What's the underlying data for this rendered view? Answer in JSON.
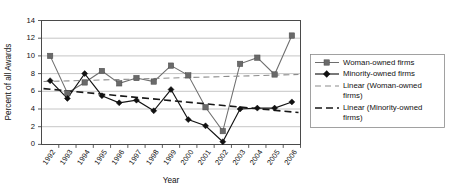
{
  "chart_data": {
    "type": "line",
    "title": "",
    "xlabel": "Year",
    "ylabel": "Percent of all Awards",
    "categories": [
      "1992",
      "1993",
      "1994",
      "1995",
      "1996",
      "1997",
      "1998",
      "1999",
      "2000",
      "2001",
      "2002",
      "2003",
      "2004",
      "2005",
      "2006"
    ],
    "ylim": [
      0,
      14
    ],
    "ytick_step": 2,
    "yticks": [
      "0",
      "2",
      "4",
      "6",
      "8",
      "10",
      "12",
      "14"
    ],
    "grid": "horizontal",
    "legend_position": "right-outside",
    "series": [
      {
        "name": "Woman-owned firms",
        "marker": "square",
        "color": "#6a6a6a",
        "values": [
          10.0,
          5.8,
          7.0,
          8.3,
          6.9,
          7.5,
          7.1,
          8.9,
          7.8,
          4.2,
          1.5,
          9.1,
          9.8,
          7.9,
          12.3
        ]
      },
      {
        "name": "Minority-owned firms",
        "marker": "diamond",
        "color": "#111111",
        "values": [
          7.2,
          5.2,
          8.0,
          5.5,
          4.7,
          5.0,
          3.8,
          6.2,
          2.8,
          2.1,
          0.3,
          4.0,
          4.1,
          4.1,
          4.8
        ]
      }
    ],
    "trendlines": [
      {
        "name": "Linear (Woman-owned firms)",
        "style": "dashed-thin",
        "color": "#8c8c8c",
        "start_value": 7.1,
        "end_value": 7.9
      },
      {
        "name": "Linear (Minority-owned firms)",
        "style": "dashed-thick",
        "color": "#171717",
        "start_value": 6.3,
        "end_value": 3.6
      }
    ],
    "legend_entries": [
      {
        "label": "Woman-owned firms",
        "key": "line-square"
      },
      {
        "label": "Minority-owned firms",
        "key": "line-diamond"
      },
      {
        "label": "Linear (Woman-owned firms)",
        "key": "dash-thin",
        "line1": "Linear (Woman-owned",
        "line2": "firms)"
      },
      {
        "label": "Linear (Minority-owned firms)",
        "key": "dash-thick",
        "line1": "Linear (Minority-owned",
        "line2": "firms)"
      }
    ]
  }
}
